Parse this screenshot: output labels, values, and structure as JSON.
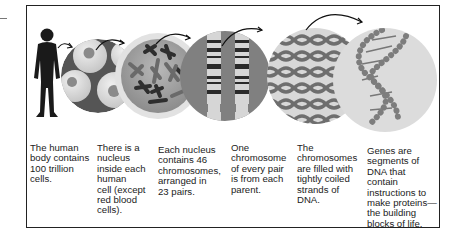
{
  "figure": {
    "type": "scale progression diagram",
    "panels": [
      {
        "id": "body",
        "illustration": "human silhouette",
        "caption": "The human body contains 100 trillion cells."
      },
      {
        "id": "cells",
        "illustration": "cells with nuclei",
        "caption": "There is a nucleus inside each human cell (except red blood cells)."
      },
      {
        "id": "nucleus",
        "illustration": "nucleus with chromosomes",
        "caption": "Each nucleus contains 46 chromosomes, arranged in 23 pairs."
      },
      {
        "id": "chromosome-pair",
        "illustration": "banded chromosome pair",
        "caption": "One chromosome of every pair is from each parent."
      },
      {
        "id": "dna-strands",
        "illustration": "coiled DNA strands",
        "caption": "The chromosomes are filled with tightly coiled strands of DNA."
      },
      {
        "id": "genes",
        "illustration": "DNA double helix",
        "caption": "Genes are segments of DNA that contain instructions to make proteins—the building blocks of life."
      }
    ],
    "caption_lines": [
      [
        "The human",
        "body contains",
        "100 trillion",
        "cells."
      ],
      [
        "There is a",
        "nucleus",
        "inside each",
        "human",
        "cell (except",
        "red blood",
        "cells)."
      ],
      [
        "Each nucleus",
        "contains 46",
        "chromosomes,",
        "arranged in",
        "23 pairs."
      ],
      [
        "One",
        "chromosome",
        "of every pair",
        "is from each",
        "parent."
      ],
      [
        "The",
        "chromosomes",
        "are filled with",
        "tightly coiled",
        "strands of",
        "DNA."
      ],
      [
        "Genes are",
        "segments of",
        "DNA that",
        "contain",
        "instructions to",
        "make proteins—",
        "the building",
        "blocks of life."
      ]
    ],
    "colors": {
      "border": "#222222",
      "silhouette": "#1a1a1a",
      "cell_fill": "#d9d9d9",
      "nucleus_bg": "#9a9a9a",
      "chromosome_dark": "#333333",
      "dna_strand": "#6e6e6e",
      "helix_bead": "#8a8a8a",
      "arrow": "#111111"
    }
  }
}
